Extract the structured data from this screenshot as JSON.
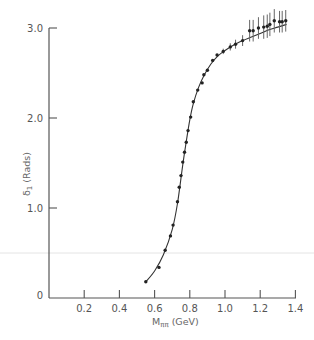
{
  "chart_data": {
    "type": "scatter",
    "title": "",
    "xlabel": "Mππ (GeV)",
    "ylabel": "δ1 (Rads)",
    "xlim": [
      0,
      1.4
    ],
    "ylim": [
      0,
      3.0
    ],
    "grid": false,
    "legend": null,
    "x_ticks": [
      "0.2",
      "0.4",
      "0.6",
      "0.8",
      "1.0",
      "1.2",
      "1.4"
    ],
    "x_tick_values": [
      0.2,
      0.4,
      0.6,
      0.8,
      1.0,
      1.2,
      1.4
    ],
    "y_ticks": [
      "0",
      "1.0",
      "2.0",
      "3.0"
    ],
    "y_tick_values": [
      0,
      1.0,
      2.0,
      3.0
    ],
    "series": [
      {
        "name": "data points",
        "x": [
          0.55,
          0.625,
          0.66,
          0.69,
          0.705,
          0.73,
          0.74,
          0.75,
          0.76,
          0.77,
          0.78,
          0.79,
          0.805,
          0.82,
          0.845,
          0.87,
          0.88,
          0.9,
          0.93,
          0.955,
          0.99,
          1.03,
          1.06,
          1.1,
          1.14,
          1.16,
          1.19,
          1.22,
          1.24,
          1.255,
          1.28,
          1.31,
          1.325,
          1.345
        ],
        "y": [
          0.18,
          0.34,
          0.53,
          0.69,
          0.81,
          1.07,
          1.23,
          1.36,
          1.51,
          1.62,
          1.73,
          1.86,
          2.01,
          2.18,
          2.31,
          2.39,
          2.48,
          2.53,
          2.64,
          2.7,
          2.74,
          2.79,
          2.82,
          2.86,
          2.97,
          2.97,
          3.0,
          3.01,
          3.02,
          3.04,
          3.08,
          3.07,
          3.07,
          3.08
        ],
        "yerr": [
          0,
          0,
          0,
          0,
          0,
          0,
          0,
          0,
          0,
          0,
          0,
          0,
          0,
          0,
          0,
          0,
          0,
          0,
          0,
          0,
          0.03,
          0.04,
          0.05,
          0.06,
          0.12,
          0.12,
          0.12,
          0.13,
          0.13,
          0.13,
          0.13,
          0.12,
          0.12,
          0.12
        ]
      },
      {
        "name": "fit curve",
        "x": [
          0.55,
          0.6,
          0.65,
          0.7,
          0.73,
          0.76,
          0.78,
          0.8,
          0.82,
          0.85,
          0.88,
          0.92,
          0.96,
          1.0,
          1.05,
          1.1,
          1.15,
          1.2,
          1.25,
          1.3,
          1.35
        ],
        "y": [
          0.18,
          0.3,
          0.48,
          0.76,
          1.05,
          1.48,
          1.74,
          1.98,
          2.16,
          2.34,
          2.47,
          2.6,
          2.69,
          2.75,
          2.81,
          2.86,
          2.9,
          2.94,
          2.98,
          3.01,
          3.04
        ]
      }
    ]
  },
  "labels": {
    "y_axis": "δ1 (Rads)",
    "y_axis_main": "δ",
    "y_axis_sub": "1",
    "y_axis_unit": " (Rads)",
    "x_axis_main": "M",
    "x_axis_sub": "ππ",
    "x_axis_unit": " (GeV)"
  }
}
